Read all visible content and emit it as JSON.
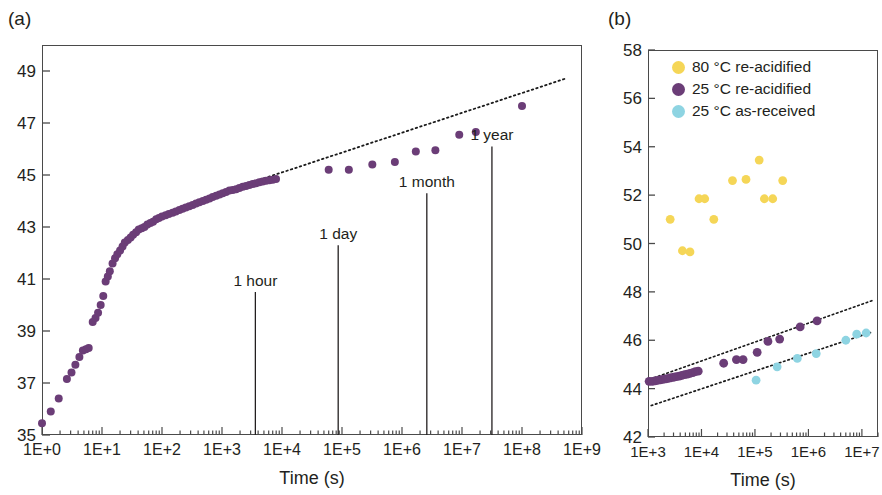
{
  "figure": {
    "panels": [
      {
        "label": "(a)",
        "xlabel": "Time (s)",
        "ylabel": "",
        "xticks": [
          "1E+0",
          "1E+1",
          "1E+2",
          "1E+3",
          "1E+4",
          "1E+5",
          "1E+6",
          "1E+7",
          "1E+8",
          "1E+9"
        ],
        "yticks": [
          "35",
          "37",
          "39",
          "41",
          "43",
          "45",
          "47",
          "49"
        ],
        "annotations": [
          "1 hour",
          "1 day",
          "1 month",
          "1 year"
        ]
      },
      {
        "label": "(b)",
        "xlabel": "Time (s)",
        "ylabel": "",
        "xticks": [
          "1E+3",
          "1E+4",
          "1E+5",
          "1E+6",
          "1E+7"
        ],
        "yticks": [
          "42",
          "44",
          "46",
          "48",
          "50",
          "52",
          "54",
          "56",
          "58"
        ],
        "legend": [
          {
            "label": "80 °C re-acidified",
            "color": "#f5d657"
          },
          {
            "label": "25 °C re-acidified",
            "color": "#6b3d77"
          },
          {
            "label": "25 °C as-received",
            "color": "#8ed4e2"
          }
        ]
      }
    ]
  },
  "colors": {
    "purple": "#6b3d77",
    "yellow": "#f5d657",
    "cyan": "#8ed4e2",
    "axis": "#4a4a4a",
    "text": "#231f20",
    "fit_line": "#1a1a1a"
  },
  "chart_data": [
    {
      "type": "scatter",
      "panel": "(a)",
      "title": "",
      "xlabel": "Time (s)",
      "ylabel": "",
      "xscale": "log",
      "xlim": [
        1,
        1000000000
      ],
      "ylim": [
        35,
        50
      ],
      "xtick_labels": [
        "1E+0",
        "1E+1",
        "1E+2",
        "1E+3",
        "1E+4",
        "1E+5",
        "1E+6",
        "1E+7",
        "1E+8",
        "1E+9"
      ],
      "ytick_labels": [
        "35",
        "37",
        "39",
        "41",
        "43",
        "45",
        "47",
        "49"
      ],
      "grid": false,
      "legend_position": "none",
      "annotations": [
        {
          "text": "1 hour",
          "x": 3600,
          "y_top": 40.5
        },
        {
          "text": "1 day",
          "x": 86400,
          "y_top": 42.3
        },
        {
          "text": "1 month",
          "x": 2592000,
          "y_top": 44.3
        },
        {
          "text": "1 year",
          "x": 31536000,
          "y_top": 46.1
        }
      ],
      "series": [
        {
          "name": "25 °C re-acidified",
          "color": "#6b3d77",
          "points": [
            [
              1.0,
              35.45
            ],
            [
              1.4,
              35.9
            ],
            [
              1.9,
              36.4
            ],
            [
              2.6,
              37.15
            ],
            [
              3.1,
              37.4
            ],
            [
              3.6,
              37.7
            ],
            [
              4.2,
              38.0
            ],
            [
              4.8,
              38.25
            ],
            [
              5.4,
              38.3
            ],
            [
              6.0,
              38.35
            ],
            [
              7.0,
              39.35
            ],
            [
              7.8,
              39.5
            ],
            [
              8.6,
              39.7
            ],
            [
              9.5,
              40.0
            ],
            [
              10.5,
              40.35
            ],
            [
              11.5,
              40.9
            ],
            [
              12.5,
              41.1
            ],
            [
              13.5,
              41.3
            ],
            [
              15,
              41.6
            ],
            [
              16.5,
              41.8
            ],
            [
              18,
              41.95
            ],
            [
              20,
              42.1
            ],
            [
              22,
              42.25
            ],
            [
              24,
              42.4
            ],
            [
              27,
              42.5
            ],
            [
              30,
              42.6
            ],
            [
              33,
              42.7
            ],
            [
              37,
              42.8
            ],
            [
              41,
              42.9
            ],
            [
              46,
              42.95
            ],
            [
              51,
              43.0
            ],
            [
              57,
              43.1
            ],
            [
              64,
              43.15
            ],
            [
              71,
              43.2
            ],
            [
              80,
              43.3
            ],
            [
              89,
              43.35
            ],
            [
              100,
              43.4
            ],
            [
              115,
              43.45
            ],
            [
              130,
              43.5
            ],
            [
              150,
              43.55
            ],
            [
              170,
              43.6
            ],
            [
              195,
              43.65
            ],
            [
              220,
              43.7
            ],
            [
              250,
              43.75
            ],
            [
              285,
              43.8
            ],
            [
              325,
              43.85
            ],
            [
              370,
              43.9
            ],
            [
              420,
              43.95
            ],
            [
              480,
              44.0
            ],
            [
              545,
              44.05
            ],
            [
              620,
              44.1
            ],
            [
              700,
              44.15
            ],
            [
              800,
              44.2
            ],
            [
              910,
              44.25
            ],
            [
              1030,
              44.3
            ],
            [
              1170,
              44.35
            ],
            [
              1330,
              44.4
            ],
            [
              1510,
              44.42
            ],
            [
              1720,
              44.45
            ],
            [
              1950,
              44.5
            ],
            [
              2220,
              44.55
            ],
            [
              2520,
              44.58
            ],
            [
              2860,
              44.62
            ],
            [
              3250,
              44.65
            ],
            [
              3700,
              44.68
            ],
            [
              4200,
              44.72
            ],
            [
              4770,
              44.75
            ],
            [
              5420,
              44.78
            ],
            [
              6160,
              44.8
            ],
            [
              7000,
              44.82
            ],
            [
              7950,
              44.85
            ],
            [
              60000,
              45.2
            ],
            [
              130000,
              45.2
            ],
            [
              320000,
              45.4
            ],
            [
              760000,
              45.5
            ],
            [
              1700000,
              45.9
            ],
            [
              3600000,
              45.95
            ],
            [
              9000000,
              46.55
            ],
            [
              17000000,
              46.65
            ],
            [
              100000000,
              47.65
            ]
          ]
        }
      ],
      "fit_line": {
        "x1": 3000,
        "y1": 44.7,
        "x2": 520000000,
        "y2": 48.7,
        "style": "dotted"
      }
    },
    {
      "type": "scatter",
      "panel": "(b)",
      "title": "",
      "xlabel": "Time (s)",
      "ylabel": "",
      "xscale": "log",
      "xlim": [
        1000,
        20000000
      ],
      "ylim": [
        42,
        58
      ],
      "xtick_labels": [
        "1E+3",
        "1E+4",
        "1E+5",
        "1E+6",
        "1E+7"
      ],
      "ytick_labels": [
        "42",
        "44",
        "46",
        "48",
        "50",
        "52",
        "54",
        "56",
        "58"
      ],
      "grid": false,
      "legend_position": "upper-center",
      "series": [
        {
          "name": "80 °C re-acidified",
          "color": "#f5d657",
          "points": [
            [
              2600,
              51.0
            ],
            [
              4400,
              49.7
            ],
            [
              6100,
              49.65
            ],
            [
              9000,
              51.85
            ],
            [
              11500,
              51.85
            ],
            [
              17000,
              51.0
            ],
            [
              38000,
              52.6
            ],
            [
              68000,
              52.65
            ],
            [
              120000,
              53.45
            ],
            [
              150000,
              51.85
            ],
            [
              215000,
              51.85
            ],
            [
              330000,
              52.6
            ]
          ]
        },
        {
          "name": "25 °C re-acidified",
          "color": "#6b3d77",
          "points": [
            [
              1050,
              44.3
            ],
            [
              1200,
              44.3
            ],
            [
              1350,
              44.32
            ],
            [
              1500,
              44.34
            ],
            [
              1700,
              44.36
            ],
            [
              1900,
              44.38
            ],
            [
              2150,
              44.4
            ],
            [
              2400,
              44.42
            ],
            [
              2700,
              44.45
            ],
            [
              3050,
              44.47
            ],
            [
              3400,
              44.5
            ],
            [
              3850,
              44.52
            ],
            [
              4300,
              44.55
            ],
            [
              4850,
              44.58
            ],
            [
              5450,
              44.6
            ],
            [
              6100,
              44.63
            ],
            [
              6900,
              44.66
            ],
            [
              7700,
              44.7
            ],
            [
              8700,
              44.72
            ],
            [
              26000,
              45.05
            ],
            [
              45000,
              45.2
            ],
            [
              60000,
              45.2
            ],
            [
              110000,
              45.5
            ],
            [
              175000,
              45.95
            ],
            [
              290000,
              46.05
            ],
            [
              700000,
              46.55
            ],
            [
              1450000,
              46.8
            ]
          ]
        },
        {
          "name": "25 °C as-received",
          "color": "#8ed4e2",
          "points": [
            [
              105000,
              44.35
            ],
            [
              260000,
              44.9
            ],
            [
              620000,
              45.25
            ],
            [
              1400000,
              45.45
            ],
            [
              5000000,
              46.0
            ],
            [
              8000000,
              46.25
            ],
            [
              12000000,
              46.3
            ]
          ]
        }
      ],
      "fit_lines": [
        {
          "series": "25 °C re-acidified",
          "x1": 1300,
          "y1": 44.45,
          "x2": 16000000,
          "y2": 47.65,
          "style": "dotted"
        },
        {
          "series": "25 °C as-received",
          "x1": 1150,
          "y1": 43.3,
          "x2": 16000000,
          "y2": 46.35,
          "style": "dotted"
        }
      ]
    }
  ]
}
